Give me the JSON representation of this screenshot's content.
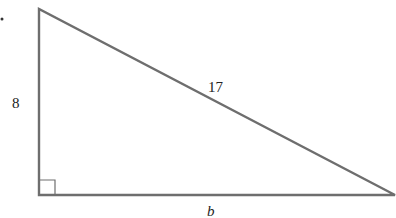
{
  "diagram": {
    "type": "right-triangle",
    "vertices": {
      "top_left": [
        39,
        9
      ],
      "bottom_left": [
        39,
        195
      ],
      "bottom_right": [
        395,
        195
      ]
    },
    "stroke_color": "#6e6e6e",
    "labels": {
      "vertical_leg": "8",
      "hypotenuse": "17",
      "horizontal_leg": "b"
    },
    "right_angle_marker": true
  }
}
